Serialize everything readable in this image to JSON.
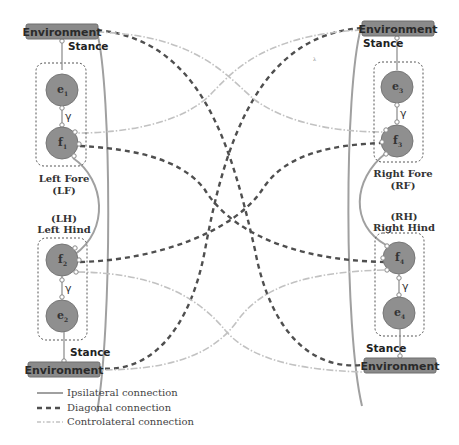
{
  "diagram": {
    "environment_label": "Environment",
    "stance_label": "Stance",
    "gamma_label": "γ",
    "legs": [
      {
        "id": "LF",
        "name": "Left Fore",
        "abbr": "(LF)",
        "e_node": "e",
        "e_sub": "1",
        "f_node": "f",
        "f_sub": "1"
      },
      {
        "id": "RF",
        "name": "Right Fore",
        "abbr": "(RF)",
        "e_node": "e",
        "e_sub": "3",
        "f_node": "f",
        "f_sub": "3"
      },
      {
        "id": "LH",
        "name": "Left Hind",
        "abbr": "(LH)",
        "e_node": "e",
        "e_sub": "2",
        "f_node": "f",
        "f_sub": "2"
      },
      {
        "id": "RH",
        "name": "Right Hind",
        "abbr": "(RH)",
        "e_node": "e",
        "e_sub": "4",
        "f_node": "f",
        "f_sub": "4"
      }
    ],
    "legend": [
      {
        "style": "solid",
        "label": "Ipsilateral connection"
      },
      {
        "style": "dashed",
        "label": "Diagonal connection"
      },
      {
        "style": "dash-dot",
        "label": "Controlateral connection"
      }
    ],
    "colors": {
      "node_fill": "#8f8f8f",
      "env_fill": "#8a8a8a",
      "ipsilateral": "#9a9a9a",
      "diagonal": "#4a4a4a",
      "controlateral": "#bdbdbd"
    },
    "stray_mark": "λ"
  }
}
